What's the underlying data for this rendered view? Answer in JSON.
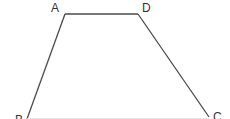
{
  "diagram": {
    "type": "trapezoid",
    "name": "ABCD",
    "stroke_color": "#4a4a4a",
    "label_color": "#333333",
    "background": "#ffffff",
    "vertices": {
      "A": {
        "label": "A",
        "x": 65,
        "y": 14
      },
      "D": {
        "label": "D",
        "x": 138,
        "y": 14
      },
      "C": {
        "label": "C",
        "x": 209,
        "y": 117
      },
      "B": {
        "label": "B",
        "x": 27,
        "y": 119
      }
    },
    "edges": [
      {
        "from": "A",
        "to": "D"
      },
      {
        "from": "A",
        "to": "B"
      },
      {
        "from": "D",
        "to": "C"
      },
      {
        "from": "B",
        "to": "C"
      }
    ]
  }
}
